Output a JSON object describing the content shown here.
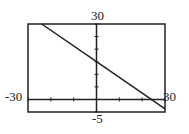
{
  "chart_data": {
    "type": "line",
    "title": "",
    "xlabel": "",
    "ylabel": "",
    "xlim": [
      -30,
      30
    ],
    "ylim": [
      -5,
      30
    ],
    "grid": false,
    "tick_labels": {
      "x_min": "-30",
      "x_max": "30",
      "y_max": "30",
      "y_min": "-5"
    },
    "series": [
      {
        "name": "line",
        "x": [
          -24,
          0,
          24,
          30
        ],
        "y": [
          30,
          15,
          0,
          -3.75
        ]
      }
    ],
    "line_color": "#222222"
  }
}
